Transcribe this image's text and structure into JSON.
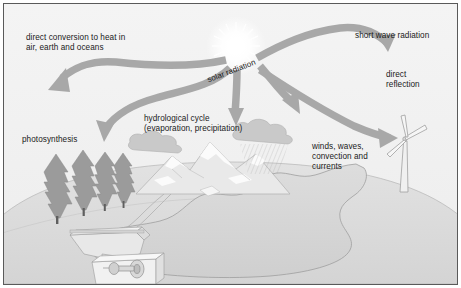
{
  "diagram": {
    "background_color": "#f2f2f2",
    "border_color": "#5a5a5a",
    "arrow_color": "#a8a8a8",
    "ink_color": "#1a1a1a"
  },
  "labels": {
    "direct_conversion": "direct conversion to heat in\nair, earth and oceans",
    "short_wave_radiation": "short wave radiation",
    "direct_reflection": "direct\nreflection",
    "solar_radiation": "solar radiation",
    "hydrological_cycle": "hydrological cycle\n(evaporation, precipitation)",
    "photosynthesis": "photosynthesis",
    "winds_waves": "winds, waves,\nconvection and\ncurrents"
  },
  "scene": {
    "sun": "sun-starburst",
    "ground": "earth-dome",
    "water": "lake-ocean",
    "trees": "conifer-forest",
    "mountains": "mountain-range",
    "clouds": "cloud-group",
    "rain": "rainfall-hatching",
    "turbine": "wind-turbine",
    "dam": "hydro-dam-generator",
    "river": "river-stream"
  },
  "arrows": {
    "heat": "arrow-to-heat-conversion",
    "photosynthesis": "arrow-to-photosynthesis",
    "hydrological": "arrow-to-hydrological-cycle",
    "evaporation": "arrow-up-evaporation",
    "short_wave": "arrow-short-wave-radiation",
    "winds": "arrow-to-winds-waves"
  }
}
